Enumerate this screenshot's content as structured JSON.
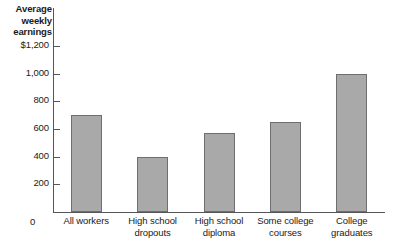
{
  "chart_data": {
    "type": "bar",
    "title": "Average weekly earnings",
    "xlabel": "",
    "ylabel": "Average weekly earnings",
    "categories": [
      "All workers",
      "High school dropouts",
      "High school diploma",
      "Some college courses",
      "College graduates"
    ],
    "values": [
      700,
      400,
      570,
      650,
      1000
    ],
    "ylim": [
      0,
      1200
    ],
    "yticks": [
      0,
      200,
      400,
      600,
      800,
      1000,
      1200
    ],
    "ytick_labels": [
      "0",
      "200",
      "400",
      "600",
      "800",
      "1,000",
      "$1,200"
    ],
    "grid": false,
    "legend": null,
    "bar_color": "#a9a9a9",
    "bar_edge_color": "#6e6e6e",
    "axis_color": "#55565a"
  },
  "axis": {
    "title_lines": [
      "Average",
      "weekly",
      "earnings"
    ],
    "zero_label": "0"
  },
  "categories_wrapped": [
    [
      "All workers"
    ],
    [
      "High school",
      "dropouts"
    ],
    [
      "High school",
      "diploma"
    ],
    [
      "Some college",
      "courses"
    ],
    [
      "College",
      "graduates"
    ]
  ]
}
